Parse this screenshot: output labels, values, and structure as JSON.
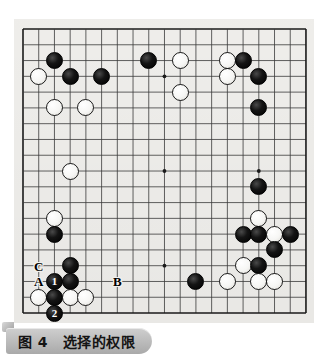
{
  "figure": {
    "caption_number": "图 4",
    "caption_title": "选择的权限",
    "caption_full": "图 4　选择的权限"
  },
  "board": {
    "size": 19,
    "origin_x": 23,
    "origin_y": 29,
    "step_x": 15.72,
    "step_y": 15.78,
    "background_color": "#f2f1ee",
    "line_color": "#3a3a3a",
    "border_color": "#1a1a1a",
    "star_points": [
      {
        "col": 3,
        "row": 3
      },
      {
        "col": 9,
        "row": 3
      },
      {
        "col": 15,
        "row": 3
      },
      {
        "col": 3,
        "row": 9
      },
      {
        "col": 9,
        "row": 9
      },
      {
        "col": 15,
        "row": 9
      },
      {
        "col": 3,
        "row": 15
      },
      {
        "col": 9,
        "row": 15
      },
      {
        "col": 15,
        "row": 15
      }
    ],
    "stones": [
      {
        "color": "black",
        "col": 2,
        "row": 2,
        "label": ""
      },
      {
        "color": "white",
        "col": 1,
        "row": 3,
        "label": ""
      },
      {
        "color": "black",
        "col": 3,
        "row": 3,
        "label": ""
      },
      {
        "color": "black",
        "col": 5,
        "row": 3,
        "label": ""
      },
      {
        "color": "black",
        "col": 8,
        "row": 2,
        "label": ""
      },
      {
        "color": "white",
        "col": 10,
        "row": 2,
        "label": ""
      },
      {
        "color": "white",
        "col": 13,
        "row": 2,
        "label": ""
      },
      {
        "color": "black",
        "col": 14,
        "row": 2,
        "label": ""
      },
      {
        "color": "white",
        "col": 13,
        "row": 3,
        "label": ""
      },
      {
        "color": "black",
        "col": 15,
        "row": 3,
        "label": ""
      },
      {
        "color": "white",
        "col": 10,
        "row": 4,
        "label": ""
      },
      {
        "color": "white",
        "col": 2,
        "row": 5,
        "label": ""
      },
      {
        "color": "white",
        "col": 4,
        "row": 5,
        "label": ""
      },
      {
        "color": "black",
        "col": 15,
        "row": 5,
        "label": ""
      },
      {
        "color": "white",
        "col": 3,
        "row": 9,
        "label": ""
      },
      {
        "color": "black",
        "col": 15,
        "row": 10,
        "label": ""
      },
      {
        "color": "white",
        "col": 2,
        "row": 12,
        "label": ""
      },
      {
        "color": "white",
        "col": 15,
        "row": 12,
        "label": ""
      },
      {
        "color": "black",
        "col": 2,
        "row": 13,
        "label": ""
      },
      {
        "color": "black",
        "col": 14,
        "row": 13,
        "label": ""
      },
      {
        "color": "black",
        "col": 15,
        "row": 13,
        "label": ""
      },
      {
        "color": "white",
        "col": 16,
        "row": 13,
        "label": ""
      },
      {
        "color": "black",
        "col": 17,
        "row": 13,
        "label": ""
      },
      {
        "color": "black",
        "col": 16,
        "row": 14,
        "label": ""
      },
      {
        "color": "black",
        "col": 3,
        "row": 15,
        "label": ""
      },
      {
        "color": "white",
        "col": 14,
        "row": 15,
        "label": ""
      },
      {
        "color": "black",
        "col": 15,
        "row": 15,
        "label": ""
      },
      {
        "color": "black",
        "col": 2,
        "row": 16,
        "label": "1"
      },
      {
        "color": "black",
        "col": 3,
        "row": 16,
        "label": ""
      },
      {
        "color": "black",
        "col": 11,
        "row": 16,
        "label": ""
      },
      {
        "color": "white",
        "col": 13,
        "row": 16,
        "label": ""
      },
      {
        "color": "white",
        "col": 15,
        "row": 16,
        "label": ""
      },
      {
        "color": "white",
        "col": 16,
        "row": 16,
        "label": ""
      },
      {
        "color": "white",
        "col": 1,
        "row": 17,
        "label": ""
      },
      {
        "color": "black",
        "col": 2,
        "row": 17,
        "label": ""
      },
      {
        "color": "white",
        "col": 3,
        "row": 17,
        "label": ""
      },
      {
        "color": "white",
        "col": 4,
        "row": 17,
        "label": ""
      },
      {
        "color": "black",
        "col": 2,
        "row": 18,
        "label": "2"
      }
    ],
    "markers": [
      {
        "text": "C",
        "col": 1,
        "row": 15
      },
      {
        "text": "A",
        "col": 1,
        "row": 16
      },
      {
        "text": "B",
        "col": 6,
        "row": 16
      }
    ]
  }
}
